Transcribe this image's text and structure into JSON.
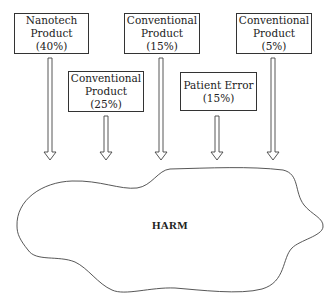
{
  "diagram": {
    "sources": [
      {
        "id": "nanotech-40",
        "lines": [
          "Nanotech",
          "Product",
          "(40%)"
        ],
        "box": {
          "x": 14,
          "y": 13,
          "w": 75,
          "h": 41
        },
        "arrow_x": 50
      },
      {
        "id": "conventional-25",
        "lines": [
          "Conventional",
          "Product",
          "(25%)"
        ],
        "box": {
          "x": 68,
          "y": 71,
          "w": 76,
          "h": 41
        },
        "arrow_x": 106
      },
      {
        "id": "conventional-15",
        "lines": [
          "Conventional",
          "Product",
          "(15%)"
        ],
        "box": {
          "x": 124,
          "y": 13,
          "w": 76,
          "h": 41
        },
        "arrow_x": 161
      },
      {
        "id": "patient-error-15",
        "lines": [
          "Patient Error",
          "(15%)"
        ],
        "box": {
          "x": 180,
          "y": 72,
          "w": 77,
          "h": 39
        },
        "arrow_x": 217
      },
      {
        "id": "conventional-5",
        "lines": [
          "Conventional",
          "Product",
          "(5%)"
        ],
        "box": {
          "x": 236,
          "y": 13,
          "w": 76,
          "h": 41
        },
        "arrow_x": 273
      }
    ],
    "target": {
      "label": "HARM"
    },
    "colors": {
      "stroke": "#333333",
      "background": "#ffffff"
    }
  }
}
